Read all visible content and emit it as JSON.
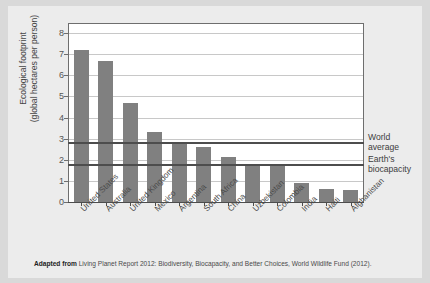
{
  "figure": {
    "title": "",
    "source_prefix": "Adapted from",
    "source_text": "Living Planet Report 2012: Biodiversity, Biocapacity, and Better Choices, World Wildlife Fund (2012)."
  },
  "chart_data": {
    "type": "bar",
    "title": "",
    "xlabel": "",
    "ylabel": "Ecological footprint (global hectares per person)",
    "ylabel_line1": "Ecological footprint",
    "ylabel_line2": "(global hectares per person)",
    "ylim": [
      0,
      8
    ],
    "yticks": [
      0,
      1,
      2,
      3,
      4,
      5,
      6,
      7,
      8
    ],
    "grid": true,
    "legend": "none",
    "bar_color": "#808080",
    "categories": [
      "United States",
      "Australia",
      "United Kingdom",
      "Mexico",
      "Argentina",
      "South Africa",
      "China",
      "Uzbekistan",
      "Colombia",
      "India",
      "Haiti",
      "Afghanistan"
    ],
    "values": [
      7.2,
      6.68,
      4.7,
      3.3,
      2.77,
      2.6,
      2.15,
      1.74,
      1.74,
      0.88,
      0.6,
      0.55
    ],
    "reference_lines": [
      {
        "label": "World average",
        "label_line1": "World",
        "label_line2": "average",
        "value": 2.77,
        "color": "#4d4d4d"
      },
      {
        "label": "Earth's biocapacity",
        "label_line1": "Earth's",
        "label_line2": "biocapacity",
        "value": 1.74,
        "color": "#4d4d4d"
      }
    ]
  }
}
